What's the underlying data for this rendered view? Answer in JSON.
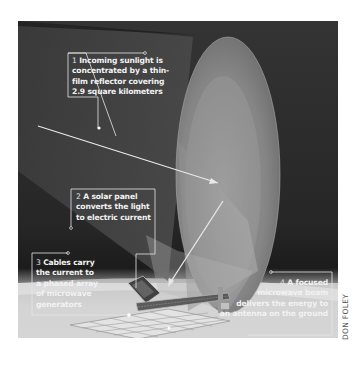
{
  "figure": {
    "type": "illustration",
    "labels": [
      {
        "number": "1",
        "lines": [
          "Incoming sunlight is",
          "concentrated by a thin-",
          "film reflector covering",
          "2.9 square kilometers"
        ]
      },
      {
        "number": "2",
        "lines": [
          "A solar panel",
          "converts the light",
          "to electric current"
        ]
      },
      {
        "number": "3",
        "lines": [
          "Cables carry",
          "the current to",
          "a phased array",
          "of microwave",
          "generators"
        ]
      },
      {
        "number": "4",
        "lines": [
          "A focused",
          "microwave beam",
          "delivers the energy to",
          "an antenna on the ground"
        ]
      }
    ],
    "credit": "DON FOLEY"
  },
  "colors": {
    "space": "#2a2a2a",
    "reflector": "#8a8a8a",
    "ground": "#d8d8d8",
    "callout": "#f0f0f0"
  }
}
